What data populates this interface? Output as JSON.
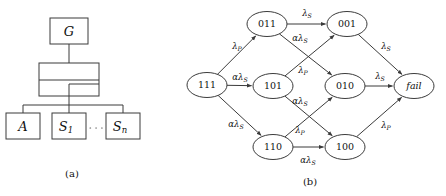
{
  "figure": {
    "panels": [
      {
        "id": "a",
        "caption": "(a)"
      },
      {
        "id": "b",
        "caption": "(b)"
      }
    ]
  },
  "panel_a": {
    "title": "system block diagram",
    "blocks": [
      {
        "name": "gateway",
        "label": "G"
      },
      {
        "name": "switch-fabric",
        "label": ""
      },
      {
        "name": "component-a",
        "label": "A"
      },
      {
        "name": "server-1",
        "label": "S",
        "sub": "1"
      },
      {
        "name": "server-n",
        "label": "S",
        "sub": "n"
      }
    ],
    "ellipsis": "·····",
    "labels": {
      "g": "G",
      "a": "A",
      "s1_base": "S",
      "s1_sub": "1",
      "sn_base": "S",
      "sn_sub": "n"
    }
  },
  "chart_data": {
    "type": "diagram",
    "subtype": "markov-chain-state-transition",
    "title": "",
    "nodes": [
      {
        "id": "111",
        "label": "111",
        "x": 207,
        "y": 85,
        "italic": false
      },
      {
        "id": "011",
        "label": "011",
        "x": 267,
        "y": 24,
        "italic": false
      },
      {
        "id": "001",
        "label": "001",
        "x": 347,
        "y": 24,
        "italic": false
      },
      {
        "id": "101",
        "label": "101",
        "x": 273,
        "y": 86,
        "italic": false
      },
      {
        "id": "010",
        "label": "010",
        "x": 345,
        "y": 86,
        "italic": false
      },
      {
        "id": "110",
        "label": "110",
        "x": 273,
        "y": 147,
        "italic": false
      },
      {
        "id": "100",
        "label": "100",
        "x": 345,
        "y": 147,
        "italic": false
      },
      {
        "id": "fail",
        "label": "fail",
        "x": 414,
        "y": 86,
        "italic": true
      }
    ],
    "edges": [
      {
        "from": "111",
        "to": "011",
        "base": "λ",
        "sub": "P",
        "prefix": "",
        "lx": 237,
        "ly": 46
      },
      {
        "from": "111",
        "to": "101",
        "base": "λ",
        "sub": "S",
        "prefix": "α",
        "lx": 240,
        "ly": 77
      },
      {
        "from": "111",
        "to": "110",
        "base": "λ",
        "sub": "S",
        "prefix": "α",
        "lx": 236,
        "ly": 124
      },
      {
        "from": "011",
        "to": "001",
        "base": "λ",
        "sub": "S",
        "prefix": "",
        "lx": 307,
        "ly": 13
      },
      {
        "from": "011",
        "to": "010",
        "base": "λ",
        "sub": "S",
        "prefix": "α",
        "lx": 300,
        "ly": 38
      },
      {
        "from": "101",
        "to": "001",
        "base": "λ",
        "sub": "P",
        "prefix": "",
        "lx": 303,
        "ly": 70
      },
      {
        "from": "101",
        "to": "100",
        "base": "λ",
        "sub": "S",
        "prefix": "α",
        "lx": 300,
        "ly": 101
      },
      {
        "from": "110",
        "to": "010",
        "base": "λ",
        "sub": "P",
        "prefix": "",
        "lx": 300,
        "ly": 130
      },
      {
        "from": "110",
        "to": "100",
        "base": "λ",
        "sub": "S",
        "prefix": "α",
        "lx": 308,
        "ly": 160
      },
      {
        "from": "001",
        "to": "fail",
        "base": "λ",
        "sub": "S",
        "prefix": "",
        "lx": 386,
        "ly": 46
      },
      {
        "from": "010",
        "to": "fail",
        "base": "λ",
        "sub": "S",
        "prefix": "",
        "lx": 380,
        "ly": 76
      },
      {
        "from": "100",
        "to": "fail",
        "base": "λ",
        "sub": "P",
        "prefix": "",
        "lx": 386,
        "ly": 125
      }
    ],
    "node_rx": 20,
    "node_ry": 12.5
  }
}
